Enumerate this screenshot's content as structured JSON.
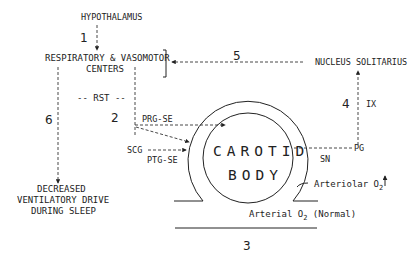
{
  "diagram": {
    "nodes": {
      "hypothalamus": "HYPOTHALAMUS",
      "centers_line1": "RESPIRATORY & VASOMOTOR",
      "centers_line2": "CENTERS",
      "nucleus_solitarius": "NUCLEUS SOLITARIUS",
      "rst": "-- RST --",
      "prg_se": "PRG-SE",
      "scg": "SCG",
      "ptg_se": "PTG-SE",
      "carotid_line1": "CAROTID",
      "carotid_line2": "BODY",
      "sn": "SN",
      "pg": "PG",
      "ix": "IX",
      "arteriolar": "Arteriolar O",
      "arteriolar_sub": "2",
      "arteriolar_arrow": "↑",
      "arterial": "Arterial O",
      "arterial_sub": "2",
      "arterial_suffix": " (Normal)",
      "outcome_line1": "DECREASED",
      "outcome_line2": "VENTILATORY DRIVE",
      "outcome_line3": "DURING SLEEP"
    },
    "pathway_numbers": {
      "p1": "1",
      "p2": "2",
      "p3": "3",
      "p4": "4",
      "p5": "5",
      "p6": "6"
    },
    "colors": {
      "line": "#333333",
      "text": "#222222",
      "background": "#ffffff"
    }
  }
}
